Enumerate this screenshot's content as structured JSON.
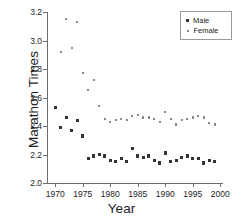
{
  "chart_data": {
    "type": "scatter",
    "title": "",
    "xlabel": "Year",
    "ylabel": "Marathon Times",
    "xlim": [
      1968.5,
      2000.5
    ],
    "ylim": [
      2.0,
      3.2
    ],
    "xticks": [
      1970,
      1975,
      1980,
      1985,
      1990,
      1995,
      2000
    ],
    "yticks": [
      "2.0",
      "2.2",
      "2.4",
      "2.6",
      "2.8",
      "3.0",
      "3.2"
    ],
    "grid": false,
    "legend_position": "top-right",
    "series": [
      {
        "name": "Male",
        "marker": "filled-square",
        "color": "#333333",
        "x": [
          1970,
          1971,
          1972,
          1973,
          1974,
          1975,
          1976,
          1977,
          1978,
          1979,
          1980,
          1981,
          1982,
          1983,
          1984,
          1985,
          1986,
          1987,
          1988,
          1989,
          1990,
          1991,
          1992,
          1993,
          1994,
          1995,
          1996,
          1997,
          1998,
          1999
        ],
        "values": [
          2.53,
          2.39,
          2.46,
          2.37,
          2.44,
          2.33,
          2.17,
          2.19,
          2.2,
          2.19,
          2.16,
          2.15,
          2.17,
          2.15,
          2.24,
          2.19,
          2.18,
          2.19,
          2.16,
          2.14,
          2.21,
          2.15,
          2.16,
          2.18,
          2.19,
          2.17,
          2.17,
          2.14,
          2.16,
          2.15
        ]
      },
      {
        "name": "Female",
        "marker": "small-square",
        "color": "#8a8a8a",
        "x": [
          1971,
          1972,
          1973,
          1974,
          1975,
          1976,
          1977,
          1978,
          1979,
          1980,
          1981,
          1982,
          1983,
          1984,
          1985,
          1986,
          1987,
          1988,
          1989,
          1990,
          1991,
          1992,
          1993,
          1994,
          1995,
          1996,
          1997,
          1998,
          1999
        ],
        "values": [
          2.92,
          3.15,
          2.95,
          3.13,
          2.77,
          2.65,
          2.72,
          2.54,
          2.45,
          2.43,
          2.44,
          2.45,
          2.44,
          2.47,
          2.48,
          2.46,
          2.46,
          2.45,
          2.43,
          2.5,
          2.45,
          2.41,
          2.44,
          2.45,
          2.46,
          2.47,
          2.46,
          2.42,
          2.41
        ]
      }
    ]
  },
  "legend": {
    "items": [
      {
        "label": "Male"
      },
      {
        "label": "Female"
      }
    ]
  }
}
